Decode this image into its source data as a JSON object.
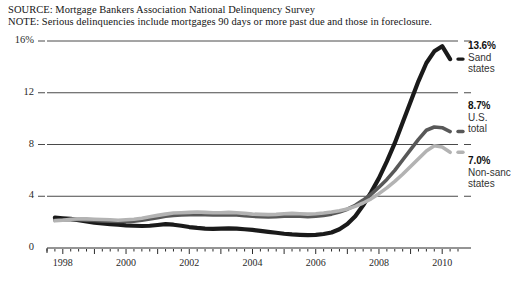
{
  "header": {
    "source": "SOURCE: Mortgage Bankers Association National Delinquency Survey",
    "note": "NOTE: Serious delinquencies include mortgages 90 days or more past due and those in foreclosure."
  },
  "colors": {
    "sand": "#1a1a1a",
    "us_total": "#585858",
    "non_sand": "#b3b3b3",
    "grid": "#4a4a4a",
    "axis": "#2b2b2b"
  },
  "callouts": [
    {
      "value": "13.6%",
      "name_line1": "Sand",
      "name_line2": "states"
    },
    {
      "value": "8.7%",
      "name_line1": "U.S.",
      "name_line2": "total"
    },
    {
      "value": "7.0%",
      "name_line1": "Non-sanc",
      "name_line2": "states"
    }
  ],
  "chart_data": {
    "type": "line",
    "title": "",
    "xlabel": "",
    "ylabel": "",
    "xlim": [
      1997.5,
      2010.5
    ],
    "ylim": [
      0,
      16
    ],
    "grid": true,
    "legend_position": "right-inline-labels",
    "ytick_labels": [
      "16%",
      "12",
      "8",
      "4",
      "0"
    ],
    "ytick_values": [
      16,
      12,
      8,
      4,
      0
    ],
    "xtick_labels": [
      "1998",
      "2000",
      "2002",
      "2004",
      "2006",
      "2008",
      "2010"
    ],
    "xtick_values": [
      1998,
      2000,
      2002,
      2004,
      2006,
      2008,
      2010
    ],
    "minor_tick_interval": 0.25,
    "x": [
      1997.75,
      1998.0,
      1998.25,
      1998.5,
      1998.75,
      1999.0,
      1999.25,
      1999.5,
      1999.75,
      2000.0,
      2000.25,
      2000.5,
      2000.75,
      2001.0,
      2001.25,
      2001.5,
      2001.75,
      2002.0,
      2002.25,
      2002.5,
      2002.75,
      2003.0,
      2003.25,
      2003.5,
      2003.75,
      2004.0,
      2004.25,
      2004.5,
      2004.75,
      2005.0,
      2005.25,
      2005.5,
      2005.75,
      2006.0,
      2006.25,
      2006.5,
      2006.75,
      2007.0,
      2007.25,
      2007.5,
      2007.75,
      2008.0,
      2008.25,
      2008.5,
      2008.75,
      2009.0,
      2009.25,
      2009.5,
      2009.75,
      2010.0,
      2010.25
    ],
    "series": [
      {
        "name": "Sand states",
        "color": "#1a1a1a",
        "end_label": "13.6%",
        "values": [
          2.35,
          2.3,
          2.25,
          2.15,
          2.05,
          1.95,
          1.9,
          1.85,
          1.8,
          1.75,
          1.72,
          1.7,
          1.72,
          1.78,
          1.85,
          1.8,
          1.72,
          1.62,
          1.55,
          1.5,
          1.48,
          1.5,
          1.52,
          1.5,
          1.45,
          1.4,
          1.32,
          1.25,
          1.18,
          1.1,
          1.05,
          1.02,
          1.0,
          1.02,
          1.08,
          1.2,
          1.45,
          1.85,
          2.45,
          3.3,
          4.3,
          5.4,
          6.7,
          8.1,
          9.7,
          11.3,
          12.9,
          14.3,
          15.2,
          15.6,
          14.6
        ]
      },
      {
        "name": "U.S. total",
        "color": "#585858",
        "end_label": "8.7%",
        "values": [
          2.15,
          2.18,
          2.2,
          2.18,
          2.15,
          2.12,
          2.1,
          2.08,
          2.05,
          2.05,
          2.08,
          2.15,
          2.25,
          2.35,
          2.45,
          2.52,
          2.55,
          2.58,
          2.6,
          2.58,
          2.55,
          2.55,
          2.58,
          2.55,
          2.5,
          2.45,
          2.42,
          2.4,
          2.42,
          2.45,
          2.48,
          2.45,
          2.42,
          2.45,
          2.52,
          2.62,
          2.78,
          3.0,
          3.3,
          3.7,
          4.15,
          4.7,
          5.3,
          6.0,
          6.8,
          7.6,
          8.4,
          9.1,
          9.35,
          9.3,
          9.0
        ]
      },
      {
        "name": "Non-sand states",
        "color": "#b3b3b3",
        "end_label": "7.0%",
        "values": [
          2.1,
          2.15,
          2.22,
          2.25,
          2.25,
          2.22,
          2.2,
          2.18,
          2.15,
          2.18,
          2.22,
          2.3,
          2.42,
          2.52,
          2.62,
          2.7,
          2.72,
          2.75,
          2.78,
          2.75,
          2.72,
          2.72,
          2.75,
          2.72,
          2.68,
          2.62,
          2.6,
          2.58,
          2.6,
          2.65,
          2.68,
          2.65,
          2.62,
          2.65,
          2.7,
          2.78,
          2.88,
          3.02,
          3.22,
          3.48,
          3.8,
          4.2,
          4.65,
          5.15,
          5.7,
          6.3,
          6.9,
          7.5,
          7.9,
          7.8,
          7.4
        ]
      }
    ]
  }
}
